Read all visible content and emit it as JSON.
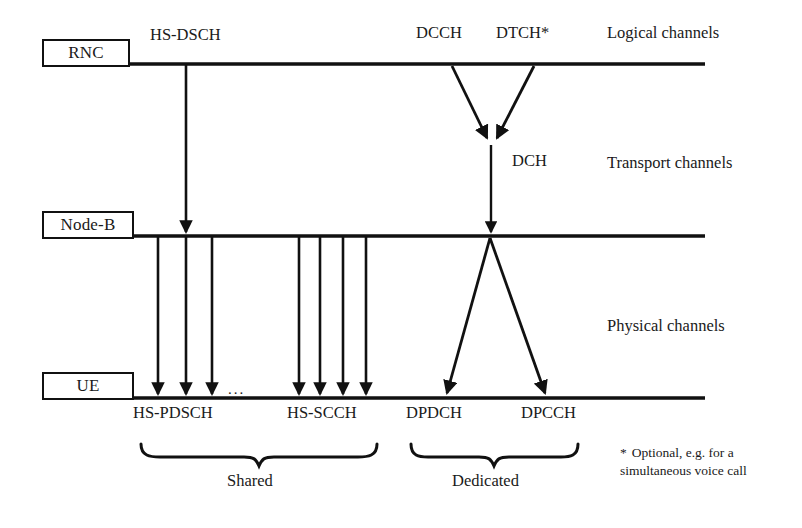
{
  "diagram": {
    "colors": {
      "ink": "#1a1a1a",
      "stroke": "#111111",
      "background": "#ffffff"
    },
    "nodes": [
      {
        "id": "rnc",
        "label": "RNC"
      },
      {
        "id": "nodeb",
        "label": "Node-B"
      },
      {
        "id": "ue",
        "label": "UE"
      }
    ],
    "layers": [
      {
        "id": "logical",
        "label": "Logical channels"
      },
      {
        "id": "transport",
        "label": "Transport channels"
      },
      {
        "id": "physical",
        "label": "Physical channels"
      }
    ],
    "channels": {
      "hs_dsch": "HS-DSCH",
      "dcch": "DCCH",
      "dtch": "DTCH*",
      "dch": "DCH",
      "hs_pdsch": "HS-PDSCH",
      "hs_scch": "HS-SCCH",
      "dpdch": "DPDCH",
      "dpcch": "DPCCH"
    },
    "ellipsis": "...",
    "groups": [
      {
        "id": "shared",
        "label": "Shared"
      },
      {
        "id": "dedicated",
        "label": "Dedicated"
      }
    ],
    "footnote": {
      "marker": "*",
      "text": "Optional, e.g. for a simultaneous voice call"
    }
  }
}
